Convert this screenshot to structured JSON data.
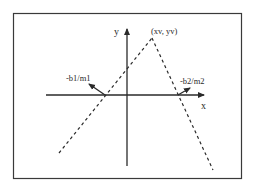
{
  "diagram": {
    "type": "piecewise-linear-peak",
    "colors": {
      "ink": "#2a2a2a",
      "frame": "#3a3a3a",
      "background": "#ffffff"
    },
    "axes": {
      "x_label": "x",
      "y_label": "y"
    },
    "labels": {
      "vertex": "(xv, yv)",
      "left_intercept": "-b1/m1",
      "right_intercept": "-b2/m2"
    },
    "lines": [
      {
        "name": "left-line",
        "style": "dashed",
        "from": "lower-left",
        "to": "vertex"
      },
      {
        "name": "right-line",
        "style": "dashed",
        "from": "vertex",
        "to": "lower-right"
      }
    ]
  }
}
